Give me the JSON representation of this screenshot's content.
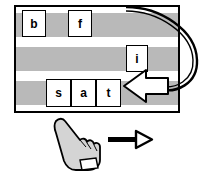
{
  "diagram": {
    "colors": {
      "band": "#b9b9b9",
      "tile": "#ffffff",
      "outline": "#000000",
      "hand": "#d4d4d4"
    },
    "rows": [
      {
        "name": "row-top",
        "tiles": [
          {
            "label": "b"
          },
          {
            "label": "f"
          }
        ]
      },
      {
        "name": "row-middle",
        "tiles": [
          {
            "label": "i"
          }
        ]
      },
      {
        "name": "row-bottom",
        "tiles": [
          {
            "label": "s"
          },
          {
            "label": "a"
          },
          {
            "label": "t"
          }
        ]
      }
    ],
    "annotations": {
      "curved_arrow": "curved-arrow-icon",
      "block_arrow_left": "left-arrowhead-icon",
      "hand": "pointing-hand-icon",
      "arrow_right": "right-arrow-icon"
    }
  }
}
